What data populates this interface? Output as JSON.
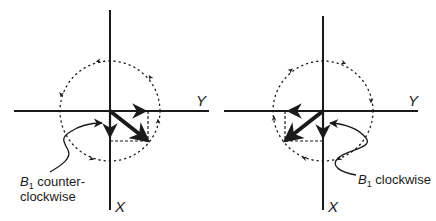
{
  "colors": {
    "ink": "#1a1a1a",
    "background": "#ffffff"
  },
  "panels": [
    {
      "id": "left",
      "axis_y_label": "Y",
      "axis_x_label": "X",
      "field_label_symbol": "B",
      "field_label_subscript": "1",
      "field_label_line1": " counter-",
      "field_label_line2": "clockwise",
      "rotation": "counter-clockwise"
    },
    {
      "id": "right",
      "axis_y_label": "Y",
      "axis_x_label": "X",
      "field_label_symbol": "B",
      "field_label_subscript": "1",
      "field_label_line1": " clockwise",
      "rotation": "clockwise"
    }
  ]
}
